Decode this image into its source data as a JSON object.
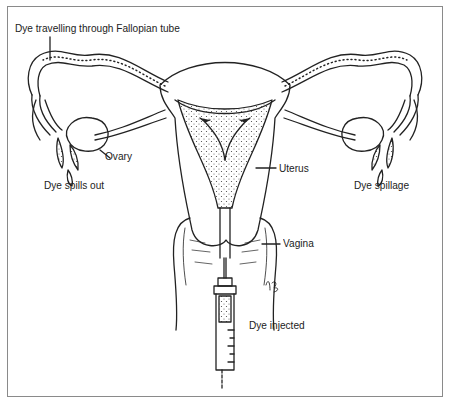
{
  "diagram": {
    "labels": {
      "tube": "Dye travelling through Fallopian tube",
      "ovary": "Ovary",
      "spills_left": "Dye spills out",
      "uterus": "Uterus",
      "spillage_right": "Dye spillage",
      "vagina": "Vagina",
      "injected": "Dye injected",
      "signature": "KB"
    },
    "colors": {
      "line": "#222222",
      "frame": "#8a8a8a",
      "background": "#ffffff"
    }
  }
}
